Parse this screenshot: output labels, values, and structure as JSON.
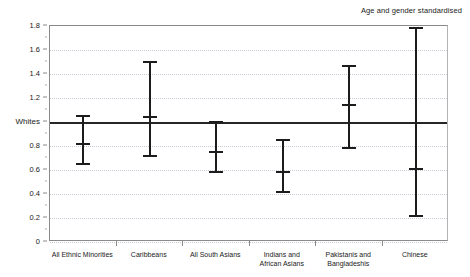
{
  "chart_data": {
    "type": "scatter",
    "title": "",
    "subtitle": "",
    "annotation": "Age and gender standardised",
    "xlabel": "",
    "ylabel": "",
    "ylim": [
      0,
      1.8
    ],
    "ytick_values": [
      0,
      0.2,
      0.4,
      0.6,
      0.8,
      1.0,
      1.2,
      1.4,
      1.6,
      1.8
    ],
    "ytick_labels": [
      "0",
      "0.2",
      "0.4",
      "0.6",
      "0.8",
      "Whites",
      "1.2",
      "1.4",
      "1.6",
      "1.8"
    ],
    "grid": true,
    "legend_position": "none",
    "reference_line": {
      "label": "Whites",
      "value": 1.0
    },
    "categories": [
      "All Ethnic Minorities",
      "Caribbeans",
      "All South Asians",
      "Indians and African Asians",
      "Pakistanis and Bangladeshis",
      "Chinese"
    ],
    "category_labels_wrapped": [
      [
        "All Ethnic Minorities"
      ],
      [
        "Caribbeans"
      ],
      [
        "All South Asians"
      ],
      [
        "Indians and",
        "African Asians"
      ],
      [
        "Pakistanis and",
        "Bangladeshis"
      ],
      [
        "Chinese"
      ]
    ],
    "values": [
      0.82,
      1.04,
      0.75,
      0.58,
      1.14,
      0.61
    ],
    "ci_lower": [
      0.65,
      0.72,
      0.58,
      0.42,
      0.78,
      0.22
    ],
    "ci_upper": [
      1.05,
      1.5,
      1.0,
      0.85,
      1.47,
      1.78
    ],
    "series": [
      {
        "name": "Age and gender standardised ratio",
        "values": [
          0.82,
          1.04,
          0.75,
          0.58,
          1.14,
          0.61
        ],
        "ci_lower": [
          0.65,
          0.72,
          0.58,
          0.42,
          0.78,
          0.22
        ],
        "ci_upper": [
          1.05,
          1.5,
          1.0,
          0.85,
          1.47,
          1.78
        ]
      }
    ],
    "colors": {
      "marker": "#1c1c1c",
      "reference_line": "#262626",
      "gridline": "#c9c9d8",
      "axis": "#8a8a8a",
      "text": "#1a1a1a",
      "background": "#ffffff"
    }
  }
}
